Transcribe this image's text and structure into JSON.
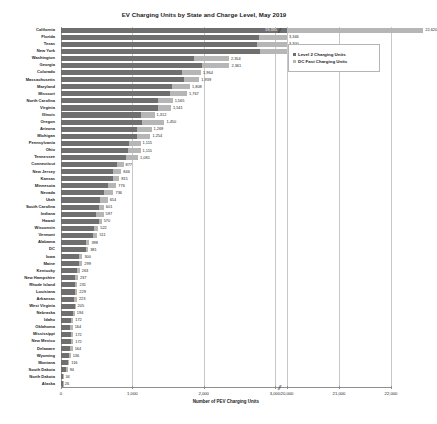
{
  "chart_data": {
    "type": "bar",
    "orientation": "horizontal",
    "stacked": true,
    "title": "EV Charging Units by State and Charge Level, May 2019",
    "xlabel": "Number of PEV Charging Units",
    "ylabel": "",
    "grid": true,
    "legend_position": "top-right",
    "axis_break": {
      "present": true,
      "from": 3000,
      "to": 20000,
      "marker": "//"
    },
    "xticks": [
      0,
      1000,
      2000,
      3000,
      20000,
      21000,
      22000
    ],
    "xtick_labels": [
      "0",
      "1,000",
      "2,000",
      "3,000",
      "20,000",
      "21,000",
      "22,000"
    ],
    "xlim_lower": [
      0,
      3000
    ],
    "xlim_upper": [
      20000,
      22000
    ],
    "series": [
      {
        "name": "Level 2 Charging Units",
        "color": "#6f6f6f"
      },
      {
        "name": "DC Fast Charging Units",
        "color": "#b6b6b6"
      }
    ],
    "categories": [
      "California",
      "Florida",
      "Texas",
      "New York",
      "Washington",
      "Georgia",
      "Colorado",
      "Massachusetts",
      "Maryland",
      "Missouri",
      "North Carolina",
      "Virginia",
      "Illinois",
      "Oregon",
      "Arizona",
      "Michigan",
      "Pennsylvania",
      "Ohio",
      "Tennessee",
      "Connecticut",
      "New Jersey",
      "Kansas",
      "Minnesota",
      "Nevada",
      "Utah",
      "South Carolina",
      "Indiana",
      "Hawaii",
      "Wisconsin",
      "Vermont",
      "Alabama",
      "DC",
      "Iowa",
      "Maine",
      "Kentucky",
      "New Hampshire",
      "Rhode Island",
      "Louisiana",
      "Arkansas",
      "West Virginia",
      "Nebraska",
      "Idaho",
      "Oklahoma",
      "Mississippi",
      "New Mexico",
      "Delaware",
      "Wyoming",
      "Montana",
      "South Dakota",
      "North Dakota",
      "Alaska"
    ],
    "rows": [
      {
        "state": "California",
        "level2": 19335,
        "dcfast": 3285,
        "total": 22620,
        "total_label": "22,620",
        "inner_label": "19,335"
      },
      {
        "state": "Florida",
        "level2": 2770,
        "dcfast": 576,
        "total": 3346,
        "total_label": "3,346",
        "inner_label": ""
      },
      {
        "state": "Texas",
        "level2": 2745,
        "dcfast": 555,
        "total": 3300,
        "total_label": "3,300",
        "inner_label": ""
      },
      {
        "state": "New York",
        "level2": 2790,
        "dcfast": 415,
        "total": 3205,
        "total_label": "3,205",
        "inner_label": ""
      },
      {
        "state": "Washington",
        "level2": 1862,
        "dcfast": 492,
        "total": 2354,
        "total_label": "2,354",
        "inner_label": ""
      },
      {
        "state": "Georgia",
        "level2": 1975,
        "dcfast": 386,
        "total": 2361,
        "total_label": "2,361",
        "inner_label": ""
      },
      {
        "state": "Colorado",
        "level2": 1702,
        "dcfast": 262,
        "total": 1964,
        "total_label": "1,964",
        "inner_label": ""
      },
      {
        "state": "Massachusetts",
        "level2": 1721,
        "dcfast": 218,
        "total": 1939,
        "total_label": "1,939",
        "inner_label": ""
      },
      {
        "state": "Maryland",
        "level2": 1558,
        "dcfast": 250,
        "total": 1808,
        "total_label": "1,808",
        "inner_label": ""
      },
      {
        "state": "Missouri",
        "level2": 1524,
        "dcfast": 243,
        "total": 1767,
        "total_label": "1,767",
        "inner_label": ""
      },
      {
        "state": "North Carolina",
        "level2": 1358,
        "dcfast": 207,
        "total": 1565,
        "total_label": "1,565",
        "inner_label": ""
      },
      {
        "state": "Virginia",
        "level2": 1355,
        "dcfast": 186,
        "total": 1541,
        "total_label": "1,541",
        "inner_label": ""
      },
      {
        "state": "Illinois",
        "level2": 1128,
        "dcfast": 184,
        "total": 1312,
        "total_label": "1,312",
        "inner_label": ""
      },
      {
        "state": "Oregon",
        "level2": 1138,
        "dcfast": 312,
        "total": 1450,
        "total_label": "1,450",
        "inner_label": ""
      },
      {
        "state": "Arizona",
        "level2": 1070,
        "dcfast": 199,
        "total": 1269,
        "total_label": "1,269",
        "inner_label": ""
      },
      {
        "state": "Michigan",
        "level2": 1064,
        "dcfast": 190,
        "total": 1254,
        "total_label": "1,254",
        "inner_label": ""
      },
      {
        "state": "Pennsylvania",
        "level2": 955,
        "dcfast": 160,
        "total": 1115,
        "total_label": "1,115",
        "inner_label": ""
      },
      {
        "state": "Ohio",
        "level2": 938,
        "dcfast": 177,
        "total": 1115,
        "total_label": "1,115",
        "inner_label": ""
      },
      {
        "state": "Tennessee",
        "level2": 905,
        "dcfast": 176,
        "total": 1081,
        "total_label": "1,081",
        "inner_label": ""
      },
      {
        "state": "Connecticut",
        "level2": 782,
        "dcfast": 95,
        "total": 877,
        "total_label": "877",
        "inner_label": ""
      },
      {
        "state": "New Jersey",
        "level2": 726,
        "dcfast": 120,
        "total": 846,
        "total_label": "846",
        "inner_label": ""
      },
      {
        "state": "Kansas",
        "level2": 735,
        "dcfast": 80,
        "total": 815,
        "total_label": "815",
        "inner_label": ""
      },
      {
        "state": "Minnesota",
        "level2": 656,
        "dcfast": 120,
        "total": 776,
        "total_label": "776",
        "inner_label": ""
      },
      {
        "state": "Nevada",
        "level2": 596,
        "dcfast": 140,
        "total": 736,
        "total_label": "736",
        "inner_label": ""
      },
      {
        "state": "Utah",
        "level2": 540,
        "dcfast": 114,
        "total": 654,
        "total_label": "654",
        "inner_label": ""
      },
      {
        "state": "South Carolina",
        "level2": 538,
        "dcfast": 63,
        "total": 601,
        "total_label": "601",
        "inner_label": ""
      },
      {
        "state": "Indiana",
        "level2": 488,
        "dcfast": 109,
        "total": 597,
        "total_label": "597",
        "inner_label": ""
      },
      {
        "state": "Hawaii",
        "level2": 538,
        "dcfast": 32,
        "total": 570,
        "total_label": "570",
        "inner_label": ""
      },
      {
        "state": "Wisconsin",
        "level2": 462,
        "dcfast": 60,
        "total": 522,
        "total_label": "522",
        "inner_label": ""
      },
      {
        "state": "Vermont",
        "level2": 443,
        "dcfast": 68,
        "total": 511,
        "total_label": "511",
        "inner_label": ""
      },
      {
        "state": "Alabama",
        "level2": 344,
        "dcfast": 54,
        "total": 398,
        "total_label": "398",
        "inner_label": ""
      },
      {
        "state": "DC",
        "level2": 344,
        "dcfast": 37,
        "total": 381,
        "total_label": "381",
        "inner_label": ""
      },
      {
        "state": "Iowa",
        "level2": 254,
        "dcfast": 46,
        "total": 300,
        "total_label": "300",
        "inner_label": ""
      },
      {
        "state": "Maine",
        "level2": 255,
        "dcfast": 44,
        "total": 299,
        "total_label": "299",
        "inner_label": ""
      },
      {
        "state": "Kentucky",
        "level2": 220,
        "dcfast": 43,
        "total": 263,
        "total_label": "263",
        "inner_label": ""
      },
      {
        "state": "New Hampshire",
        "level2": 203,
        "dcfast": 34,
        "total": 237,
        "total_label": "237",
        "inner_label": ""
      },
      {
        "state": "Rhode Island",
        "level2": 201,
        "dcfast": 30,
        "total": 231,
        "total_label": "231",
        "inner_label": ""
      },
      {
        "state": "Louisiana",
        "level2": 190,
        "dcfast": 39,
        "total": 229,
        "total_label": "229",
        "inner_label": ""
      },
      {
        "state": "Arkansas",
        "level2": 186,
        "dcfast": 37,
        "total": 223,
        "total_label": "223",
        "inner_label": ""
      },
      {
        "state": "West Virginia",
        "level2": 193,
        "dcfast": 12,
        "total": 205,
        "total_label": "205",
        "inner_label": ""
      },
      {
        "state": "Nebraska",
        "level2": 162,
        "dcfast": 32,
        "total": 194,
        "total_label": "194",
        "inner_label": ""
      },
      {
        "state": "Idaho",
        "level2": 139,
        "dcfast": 33,
        "total": 172,
        "total_label": "172",
        "inner_label": ""
      },
      {
        "state": "Oklahoma",
        "level2": 127,
        "dcfast": 37,
        "total": 164,
        "total_label": "164",
        "inner_label": ""
      },
      {
        "state": "Mississippi",
        "level2": 139,
        "dcfast": 33,
        "total": 172,
        "total_label": "172",
        "inner_label": ""
      },
      {
        "state": "New Mexico",
        "level2": 137,
        "dcfast": 35,
        "total": 172,
        "total_label": "172",
        "inner_label": ""
      },
      {
        "state": "Delaware",
        "level2": 133,
        "dcfast": 31,
        "total": 164,
        "total_label": "164",
        "inner_label": ""
      },
      {
        "state": "Wyoming",
        "level2": 118,
        "dcfast": 18,
        "total": 136,
        "total_label": "136",
        "inner_label": ""
      },
      {
        "state": "Montana",
        "level2": 97,
        "dcfast": 19,
        "total": 116,
        "total_label": "116",
        "inner_label": ""
      },
      {
        "state": "South Dakota",
        "level2": 74,
        "dcfast": 20,
        "total": 94,
        "total_label": "94",
        "inner_label": ""
      },
      {
        "state": "North Dakota",
        "level2": 28,
        "dcfast": 6,
        "total": 34,
        "total_label": "34",
        "inner_label": ""
      },
      {
        "state": "Alaska",
        "level2": 22,
        "dcfast": 4,
        "total": 26,
        "total_label": "26",
        "inner_label": ""
      }
    ]
  },
  "legend": {
    "items": [
      {
        "label": "Level 2 Charging Units",
        "color": "#6f6f6f"
      },
      {
        "label": "DC Fast Charging Units",
        "color": "#b6b6b6"
      }
    ]
  }
}
